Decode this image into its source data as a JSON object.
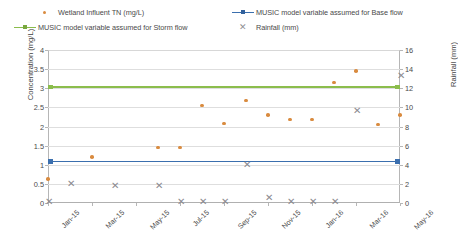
{
  "legend": {
    "items": [
      {
        "label": "Wetland Influent TN (mg/L)",
        "marker": "dot-marker",
        "color": "#d98b3f"
      },
      {
        "label": "MUSIC model variable assumed for Base flow",
        "marker": "line-marker-blue",
        "color": "#3b6fae"
      },
      {
        "label": "MUSIC model variable assumed for Storm flow",
        "marker": "line-marker-green",
        "color": "#8bbd4c"
      },
      {
        "label": "Rainfall (mm)",
        "marker": "x-marker",
        "color": "#8f8f93"
      }
    ]
  },
  "axes": {
    "left_title": "Concentration (mg/L)",
    "right_title": "Rainfall (mm)",
    "left_ticks": [
      "4",
      "3.5",
      "3",
      "2.5",
      "2",
      "1.5",
      "1",
      "0.5",
      "0"
    ],
    "right_ticks": [
      "16",
      "14",
      "12",
      "10",
      "8",
      "6",
      "4",
      "2",
      "0"
    ],
    "x_ticks": [
      "Jan-15",
      "Mar-15",
      "May-15",
      "Jul-15",
      "Sep-15",
      "Nov-15",
      "Jan-16",
      "Mar-16",
      "May-16"
    ]
  },
  "chart_data": {
    "type": "scatter",
    "title": "",
    "xlabel": "",
    "ylabel": "Concentration (mg/L)",
    "y2label": "Rainfall (mm)",
    "ylim": [
      0,
      4
    ],
    "y2lim": [
      0,
      16
    ],
    "xlim": [
      "Jan-15",
      "May-16"
    ],
    "grid": true,
    "legend_position": "top",
    "x_categories": [
      "Jan-15",
      "Feb-15",
      "Mar-15",
      "Apr-15",
      "May-15",
      "Jun-15",
      "Jul-15",
      "Aug-15",
      "Sep-15",
      "Oct-15",
      "Nov-15",
      "Dec-15",
      "Jan-16",
      "Feb-16",
      "Mar-16",
      "Apr-16",
      "May-16"
    ],
    "series": [
      {
        "name": "Wetland Influent TN (mg/L)",
        "type": "scatter",
        "axis": "left",
        "color": "#d98b3f",
        "marker": "circle",
        "points": [
          {
            "x": "Jan-15",
            "y": 0.62
          },
          {
            "x": "Mar-15",
            "y": 1.2
          },
          {
            "x": "Jun-15",
            "y": 1.45
          },
          {
            "x": "Jul-15",
            "y": 1.45
          },
          {
            "x": "Aug-15",
            "y": 2.55
          },
          {
            "x": "Sep-15",
            "y": 2.08
          },
          {
            "x": "Oct-15",
            "y": 2.68
          },
          {
            "x": "Nov-15",
            "y": 2.3
          },
          {
            "x": "Dec-15",
            "y": 2.18
          },
          {
            "x": "Jan-16",
            "y": 2.18
          },
          {
            "x": "Feb-16",
            "y": 3.15
          },
          {
            "x": "Mar-16",
            "y": 3.45
          },
          {
            "x": "Apr-16",
            "y": 2.05
          },
          {
            "x": "May-16",
            "y": 2.3
          }
        ]
      },
      {
        "name": "MUSIC model variable assumed for Base flow",
        "type": "line",
        "axis": "left",
        "color": "#3b6fae",
        "value": 1.1
      },
      {
        "name": "MUSIC model variable assumed for Storm flow",
        "type": "line",
        "axis": "left",
        "color": "#8bbd4c",
        "value": 3.05
      },
      {
        "name": "Rainfall (mm)",
        "type": "scatter",
        "axis": "right",
        "color": "#8a8a90",
        "marker": "x",
        "points": [
          {
            "x": "Jan-15",
            "y": 0.1
          },
          {
            "x": "Feb-15",
            "y": 2.0
          },
          {
            "x": "Apr-15",
            "y": 1.8
          },
          {
            "x": "Jun-15",
            "y": 1.8
          },
          {
            "x": "Jul-15",
            "y": 0.1
          },
          {
            "x": "Aug-15",
            "y": 0.1
          },
          {
            "x": "Sep-15",
            "y": 0.1
          },
          {
            "x": "Oct-15",
            "y": 4.0
          },
          {
            "x": "Nov-15",
            "y": 0.5
          },
          {
            "x": "Dec-15",
            "y": 0.1
          },
          {
            "x": "Jan-16",
            "y": 0.1
          },
          {
            "x": "Feb-16",
            "y": 0.1
          },
          {
            "x": "Mar-16",
            "y": 9.6
          },
          {
            "x": "May-16",
            "y": 13.3
          }
        ]
      }
    ]
  }
}
